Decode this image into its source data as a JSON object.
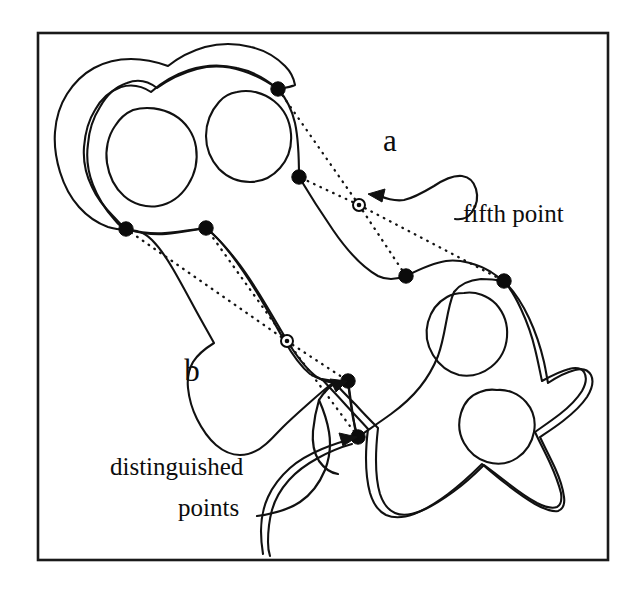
{
  "figure": {
    "background_color": "#ffffff",
    "ink_color": "#111111",
    "frame": {
      "x": 38,
      "y": 33,
      "width": 570,
      "height": 527,
      "stroke_color": "#1a1a1a"
    },
    "region_labels": [
      {
        "id": "a",
        "text": "a",
        "x": 390,
        "y": 151
      },
      {
        "id": "b",
        "text": "b",
        "x": 192,
        "y": 381
      }
    ],
    "callouts": [
      {
        "id": "fifth-point",
        "text": "fifth point",
        "lines": [
          "fifth point"
        ],
        "x": 463,
        "y": 222,
        "points_to": "fifth-point-a-marker"
      },
      {
        "id": "distinguished-points",
        "text": "distinguished points",
        "lines": [
          "distinguished",
          "points"
        ],
        "line1_x": 110,
        "line1_y": 475,
        "line2_x": 178,
        "line2_y": 516,
        "points_to": [
          "distinguished-point-b3",
          "distinguished-point-b4"
        ]
      }
    ],
    "distinguished_points": [
      {
        "id": "distinguished-point-a1",
        "region": "a",
        "x": 278,
        "y": 89
      },
      {
        "id": "distinguished-point-a2",
        "region": "a",
        "x": 299,
        "y": 177
      },
      {
        "id": "distinguished-point-a3",
        "region": "a",
        "x": 406,
        "y": 276
      },
      {
        "id": "distinguished-point-a4",
        "region": "a",
        "x": 504,
        "y": 281
      },
      {
        "id": "distinguished-point-b1",
        "region": "b",
        "x": 126,
        "y": 229
      },
      {
        "id": "distinguished-point-b2",
        "region": "b",
        "x": 206,
        "y": 228
      },
      {
        "id": "distinguished-point-b3",
        "region": "b",
        "x": 348,
        "y": 381
      },
      {
        "id": "distinguished-point-b4",
        "region": "b",
        "x": 358,
        "y": 437
      }
    ],
    "fifth_points": [
      {
        "id": "fifth-point-a-marker",
        "region": "a",
        "x": 359,
        "y": 205
      },
      {
        "id": "fifth-point-b-marker",
        "region": "b",
        "x": 287,
        "y": 341
      }
    ],
    "holes": [
      {
        "id": "hole-upper-left",
        "cx": 150,
        "cy": 150
      },
      {
        "id": "hole-upper-right",
        "cx": 249,
        "cy": 135
      },
      {
        "id": "hole-lower-middle",
        "cx": 470,
        "cy": 327
      },
      {
        "id": "hole-lower-right",
        "cx": 500,
        "cy": 421
      }
    ]
  }
}
